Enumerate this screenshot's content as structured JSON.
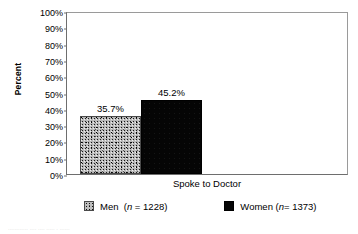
{
  "chart_data": {
    "type": "bar",
    "title": "",
    "xlabel": "",
    "ylabel": "Percent",
    "categories": [
      "Spoke to Doctor"
    ],
    "ylim": [
      0,
      100
    ],
    "y_tick_labels": [
      "100%",
      "90%",
      "80%",
      "70%",
      "60%",
      "50%",
      "40%",
      "30%",
      "20%",
      "10%",
      "0%"
    ],
    "y_tick_values": [
      100,
      90,
      80,
      70,
      60,
      50,
      40,
      30,
      20,
      10,
      0
    ],
    "grid": false,
    "legend_position": "bottom",
    "series": [
      {
        "name": "Men",
        "legend_label": "Men",
        "legend_n_prefix": "(",
        "legend_n_italic": "n",
        "legend_n_suffix": " = 1228)",
        "n": 1228,
        "values": [
          35.7
        ],
        "value_labels": [
          "35.7%"
        ],
        "fill": "speckled-gray",
        "color": "#b9b9b9"
      },
      {
        "name": "Women",
        "legend_label": "Women",
        "legend_n_prefix": "(",
        "legend_n_italic": "n",
        "legend_n_suffix": "= 1373)",
        "n": 1373,
        "values": [
          45.2
        ],
        "value_labels": [
          "45.2%"
        ],
        "fill": "solid-black",
        "color": "#050505"
      }
    ]
  },
  "axis": {
    "y_title": "Percent",
    "x_category": "Spoke to Doctor"
  },
  "caption": {
    "remnant": "............  ....  ....  .....   .  ......"
  }
}
